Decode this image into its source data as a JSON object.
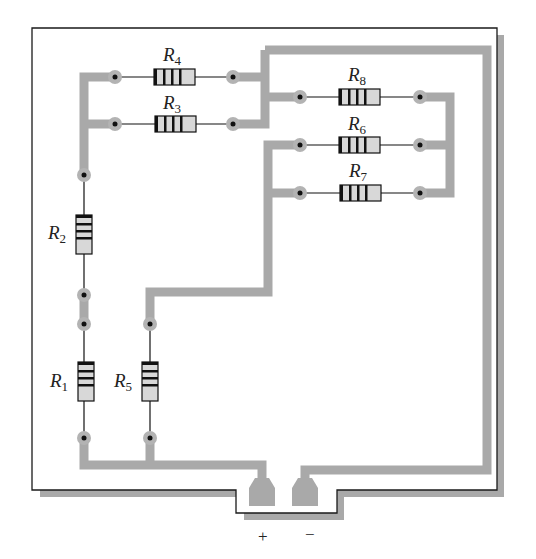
{
  "colors": {
    "trace": "#a9a9a9",
    "pad": "#b0b0b0",
    "board_outline": "#1a1a1a",
    "board_shadow": "#a9a9a9",
    "resistor_body": "#d8d8d8",
    "resistor_band": "#111111",
    "wire": "#111111"
  },
  "resistors": [
    {
      "id": "R1",
      "letter": "R",
      "sub": "1",
      "orientation": "vertical"
    },
    {
      "id": "R2",
      "letter": "R",
      "sub": "2",
      "orientation": "vertical"
    },
    {
      "id": "R3",
      "letter": "R",
      "sub": "3",
      "orientation": "horizontal"
    },
    {
      "id": "R4",
      "letter": "R",
      "sub": "4",
      "orientation": "horizontal"
    },
    {
      "id": "R5",
      "letter": "R",
      "sub": "5",
      "orientation": "vertical"
    },
    {
      "id": "R6",
      "letter": "R",
      "sub": "6",
      "orientation": "horizontal"
    },
    {
      "id": "R7",
      "letter": "R",
      "sub": "7",
      "orientation": "horizontal"
    },
    {
      "id": "R8",
      "letter": "R",
      "sub": "8",
      "orientation": "horizontal"
    }
  ],
  "terminals": {
    "positive": "+",
    "negative": "−"
  }
}
